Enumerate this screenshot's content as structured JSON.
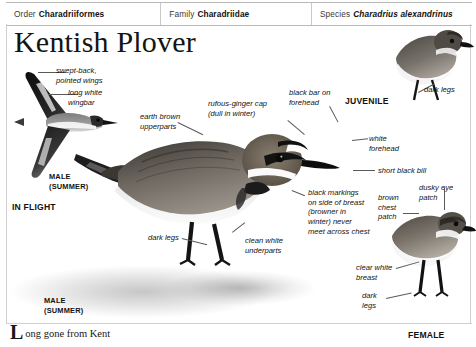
{
  "taxonomy": [
    {
      "key": "Order",
      "value": "Charadriiformes",
      "italic": false
    },
    {
      "key": "Family",
      "value": "Charadriidae",
      "italic": false
    },
    {
      "key": "Species",
      "value": "Charadrius alexandrinus",
      "italic": true
    }
  ],
  "title": "Kentish Plover",
  "annotations": {
    "swept_back": "swept-back,\npointed wings",
    "long_white_wingbar": "long white\nwingbar",
    "earth_brown": "earth brown\nupperparts",
    "rufous_cap": "rufous-ginger cap\n(dull in winter)",
    "black_bar": "black bar on\nforehead",
    "white_forehead": "white\nforehead",
    "short_black_bill": "short black bill",
    "dark_legs_juv": "dark legs",
    "black_markings": "black markings\non side of breast\n(browner in\nwinter) never\nmeet across chest",
    "brown_chest_patch": "brown\nchest\npatch",
    "dusky_eye_patch": "dusky eye\npatch",
    "dark_legs_main": "dark legs",
    "clean_white_underparts": "clean white\nunderparts",
    "clear_white_breast": "clear white\nbreast",
    "dark_legs_female": "dark\nlegs"
  },
  "captions": {
    "male_summer_flight": "MALE\n(SUMMER)",
    "in_flight": "IN FLIGHT",
    "juvenile": "JUVENILE",
    "male_summer_main": "MALE\n(SUMMER)",
    "female": "FEMALE"
  },
  "footer": {
    "dropcap": "L",
    "text": "ong gone from Kent"
  },
  "colors": {
    "rule": "#cfcfcf",
    "text": "#111111",
    "leader": "#5a5a5a",
    "page_background": "#ffffff"
  }
}
